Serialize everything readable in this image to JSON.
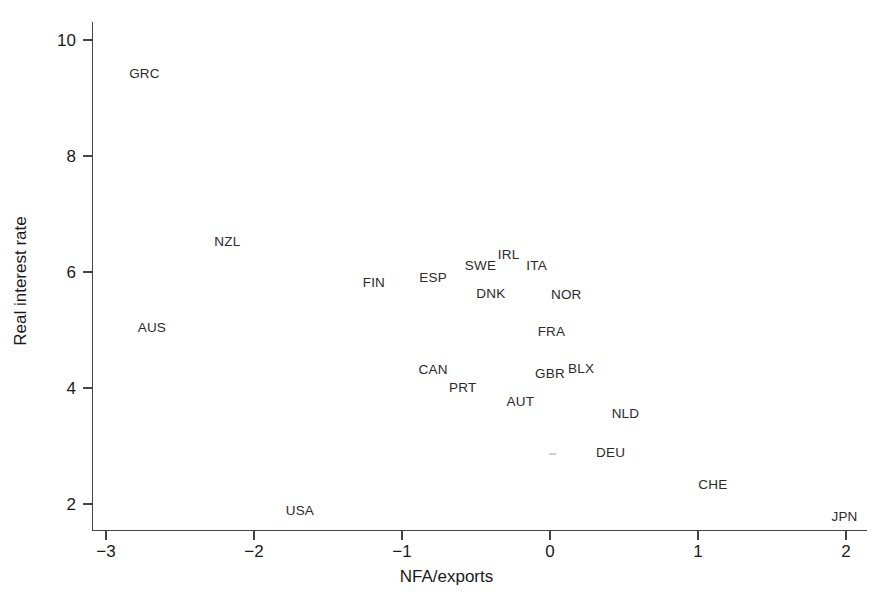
{
  "chart_data": {
    "type": "scatter",
    "title": "",
    "subtitle": "",
    "xlabel": "NFA/exports",
    "ylabel": "Real interest rate",
    "xlim": [
      -3.1,
      2.1
    ],
    "ylim": [
      1.7,
      10.2
    ],
    "xticks": [
      -3,
      -2,
      -1,
      0,
      1,
      2
    ],
    "xticklabels": [
      "−3",
      "−2",
      "−1",
      "0",
      "1",
      "2"
    ],
    "yticks": [
      2,
      4,
      6,
      8,
      10
    ],
    "yticklabels": [
      "2",
      "4",
      "6",
      "8",
      "10"
    ],
    "grid": false,
    "legend": false,
    "marker_style": "text-labels-only",
    "points": [
      {
        "label": "GRC",
        "x": -2.74,
        "y": 9.41
      },
      {
        "label": "NZL",
        "x": -2.18,
        "y": 6.52
      },
      {
        "label": "AUS",
        "x": -2.69,
        "y": 5.03
      },
      {
        "label": "FIN",
        "x": -1.19,
        "y": 5.81
      },
      {
        "label": "ESP",
        "x": -0.79,
        "y": 5.9
      },
      {
        "label": "SWE",
        "x": -0.47,
        "y": 6.1
      },
      {
        "label": "IRL",
        "x": -0.28,
        "y": 6.29
      },
      {
        "label": "ITA",
        "x": -0.09,
        "y": 6.1
      },
      {
        "label": "DNK",
        "x": -0.4,
        "y": 5.62
      },
      {
        "label": "NOR",
        "x": 0.11,
        "y": 5.6
      },
      {
        "label": "FRA",
        "x": 0.01,
        "y": 4.97
      },
      {
        "label": "CAN",
        "x": -0.79,
        "y": 4.31
      },
      {
        "label": "PRT",
        "x": -0.59,
        "y": 4.0
      },
      {
        "label": "GBR",
        "x": 0.0,
        "y": 4.24
      },
      {
        "label": "BLX",
        "x": 0.21,
        "y": 4.33
      },
      {
        "label": "AUT",
        "x": -0.2,
        "y": 3.76
      },
      {
        "label": "NLD",
        "x": 0.51,
        "y": 3.55
      },
      {
        "label": "DEU",
        "x": 0.41,
        "y": 2.88
      },
      {
        "label": "CHE",
        "x": 1.1,
        "y": 2.33
      },
      {
        "label": "USA",
        "x": -1.69,
        "y": 1.88
      },
      {
        "label": "JPN",
        "x": 1.99,
        "y": 1.78
      }
    ]
  },
  "colors": {
    "background": "#ffffff",
    "axis": "#444444",
    "text": "#1a1a1a",
    "point_label": "#2b2b2b"
  }
}
